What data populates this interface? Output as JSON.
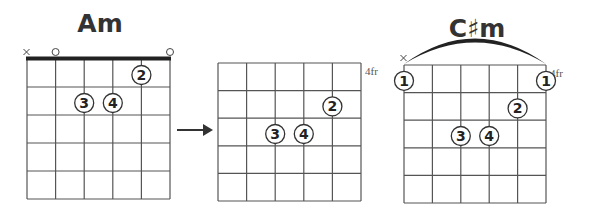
{
  "diagrams": [
    {
      "id": "am",
      "title": "Am",
      "fret_label": "",
      "grid": {
        "x": 27,
        "y": 59,
        "w": 143,
        "h": 140
      },
      "nut": true,
      "string_markers": [
        {
          "string": 0,
          "type": "x"
        },
        {
          "string": 1,
          "type": "o"
        },
        {
          "string": 5,
          "type": "o"
        }
      ],
      "fingers": [
        {
          "string": 4,
          "fret": 1,
          "label": "2"
        },
        {
          "string": 2,
          "fret": 2,
          "label": "3"
        },
        {
          "string": 3,
          "fret": 2,
          "label": "4"
        }
      ],
      "barre": null
    },
    {
      "id": "am-shape-moved",
      "title": "",
      "fret_label": "4fr",
      "grid": {
        "x": 218,
        "y": 63,
        "w": 143,
        "h": 138
      },
      "nut": false,
      "string_markers": [],
      "fingers": [
        {
          "string": 4,
          "fret": 2,
          "label": "2"
        },
        {
          "string": 2,
          "fret": 3,
          "label": "3"
        },
        {
          "string": 3,
          "fret": 3,
          "label": "4"
        }
      ],
      "barre": null
    },
    {
      "id": "csharp-m",
      "title": "C♯m",
      "fret_label": "4fr",
      "grid": {
        "x": 404,
        "y": 65,
        "w": 142,
        "h": 138
      },
      "nut": false,
      "string_markers": [
        {
          "string": 0,
          "type": "x"
        }
      ],
      "fingers": [
        {
          "string": 0,
          "fret": 1,
          "label": "1",
          "on_edge": true
        },
        {
          "string": 5,
          "fret": 1,
          "label": "1",
          "on_edge": true
        },
        {
          "string": 4,
          "fret": 2,
          "label": "2"
        },
        {
          "string": 2,
          "fret": 3,
          "label": "3"
        },
        {
          "string": 3,
          "fret": 3,
          "label": "4"
        }
      ],
      "barre": {
        "from_string": 0,
        "to_string": 5,
        "fret": 1
      }
    }
  ],
  "arrow": {
    "from": "am",
    "to": "am-shape-moved",
    "direction": "right"
  },
  "labels": {
    "am_title": "Am",
    "csm_title": "C♯m",
    "fr_label_2": "4fr",
    "fr_label_3": "4fr",
    "mute": "×",
    "open": "○"
  }
}
